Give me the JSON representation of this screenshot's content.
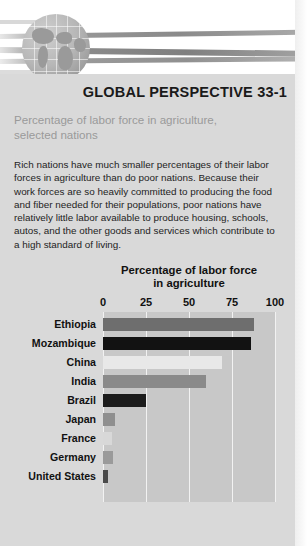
{
  "banner": {
    "globe_icon": "globe-icon",
    "streaks": [
      "streak-1",
      "streak-2",
      "streak-3"
    ]
  },
  "header": {
    "title": "GLOBAL PERSPECTIVE 33-1",
    "subtitle": "Percentage of labor force in agriculture,\nselected nations"
  },
  "body": {
    "paragraph": "Rich nations have much smaller percentages of their labor forces in agriculture than do poor nations. Because their work forces are so heavily committed to producing the food and fiber needed for their populations, poor nations have relatively little labor available to produce housing, schools, autos, and the other goods and services which contribute to a high standard of living."
  },
  "colors": {
    "panel": "#d9d9d9",
    "plot_background": "#c8c8c8",
    "gridline": "#f2f2f2",
    "text": "#111111",
    "subtitle": "#9a9a9a"
  },
  "chart_data": {
    "type": "bar",
    "orientation": "horizontal",
    "title": "Percentage of labor force\nin agriculture",
    "title_line1": "Percentage of labor force",
    "title_line2": "in agriculture",
    "xlabel": "",
    "ylabel": "",
    "xlim": [
      0,
      100
    ],
    "ticks": [
      0,
      25,
      50,
      75,
      100
    ],
    "tick_labels": [
      "0",
      "25",
      "50",
      "75",
      "100"
    ],
    "grid": true,
    "legend": "none",
    "categories": [
      "Ethiopia",
      "Mozambique",
      "China",
      "India",
      "Brazil",
      "Japan",
      "France",
      "Germany",
      "United States"
    ],
    "values": [
      88,
      86,
      69,
      60,
      25,
      7,
      5,
      6,
      3
    ],
    "bar_colors": [
      "#6e6e6e",
      "#121212",
      "#e8e8e8",
      "#8a8a8a",
      "#1c1c1c",
      "#8f8f8f",
      "#d8d8d8",
      "#9a9a9a",
      "#4a4a4a"
    ]
  }
}
